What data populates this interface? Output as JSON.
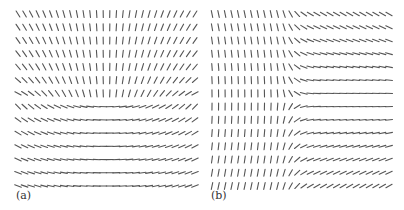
{
  "figure": {
    "panels": [
      {
        "id": "a",
        "label": "(a)"
      },
      {
        "id": "b",
        "label": "(b)"
      }
    ]
  },
  "style": {
    "stroke_color": "#555555",
    "background": "#ffffff",
    "label_color": "#333333",
    "stroke_length": 7,
    "stroke_width": 1.1
  },
  "chart_data": [
    {
      "type": "direction-field",
      "title": "",
      "panel_label": "(a)",
      "rows": 14,
      "cols": 28,
      "x_start": 18,
      "x_end": 195,
      "y_start": 14,
      "y_end": 186,
      "label_pos": [
        17,
        190
      ],
      "description": "Orientation field symmetric about center column: near-vertical strokes at top (left side tilted '\\', right side tilted '/'), bending through a horizontal arc near row 7, and nearly horizontal strokes at bottom (left slightly '\\', right slightly '/').",
      "model": {
        "center_col": 13.5,
        "upper_rows_k_deg_per_col": [
          2.4,
          2.5,
          2.6,
          2.8,
          3.0,
          3.6,
          4.6
        ],
        "lower_rows_k_deg_per_col": [
          3.4,
          2.7,
          2.3,
          2.0,
          1.8,
          1.6,
          1.5
        ]
      }
    },
    {
      "type": "direction-field",
      "title": "",
      "panel_label": "(b)",
      "rows": 14,
      "cols": 28,
      "x_start": 212,
      "x_end": 389,
      "y_start": 14,
      "y_end": 186,
      "label_pos": [
        212,
        190
      ],
      "description": "Left half near-vertical (top rows tilted slightly '\\', bottom rows slightly '/'); right half shallow strokes: top rows tilted '\\' about 28 deg, horizontal at row 7, bottom rows tilted '/' about 28 deg; transition near column 12.",
      "model": {
        "transition_col": 12.5,
        "transition_width": 1.6,
        "center_row": 6.5,
        "left_deg_per_row": 1.8,
        "right_deg_per_row": 4.4
      }
    }
  ]
}
